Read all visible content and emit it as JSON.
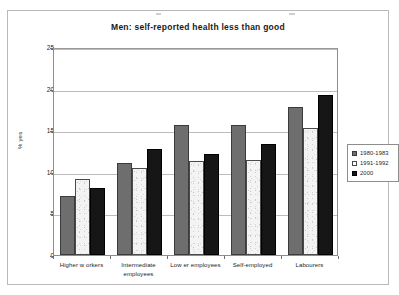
{
  "chart_data": {
    "type": "bar",
    "title": "Men: self-reported health less than good",
    "xlabel": "",
    "ylabel": "% yes",
    "ylim": [
      0,
      25
    ],
    "yticks": [
      0,
      5,
      10,
      15,
      20,
      25
    ],
    "grid": true,
    "legend_position": "right",
    "categories": [
      "Higher w orkers",
      "Intermediate employees",
      "Low er employees",
      "Self-employed",
      "Labourers"
    ],
    "series": [
      {
        "name": "1980-1983",
        "color": "#6e6e6e",
        "values": [
          7.1,
          11.0,
          15.6,
          15.6,
          17.8
        ]
      },
      {
        "name": "1991-1992",
        "color": "#fbfbfb",
        "values": [
          9.1,
          10.4,
          11.3,
          11.4,
          15.3
        ]
      },
      {
        "name": "2000",
        "color": "#161616",
        "values": [
          8.0,
          12.7,
          12.2,
          13.4,
          19.2
        ]
      }
    ]
  },
  "chart": {
    "title": "Men: self-reported health less than good",
    "y_axis_title": "% yes",
    "y_ticks": [
      "0",
      "5",
      "10",
      "15",
      "20",
      "25"
    ],
    "categories": [
      {
        "line1": "Higher w orkers",
        "line2": ""
      },
      {
        "line1": "Intermediate",
        "line2": "employees"
      },
      {
        "line1": "Low er employees",
        "line2": ""
      },
      {
        "line1": "Self-employed",
        "line2": ""
      },
      {
        "line1": "Labourers",
        "line2": ""
      }
    ],
    "legend": [
      {
        "label": "1980-1983"
      },
      {
        "label": "1991-1992"
      },
      {
        "label": "2000"
      }
    ]
  }
}
